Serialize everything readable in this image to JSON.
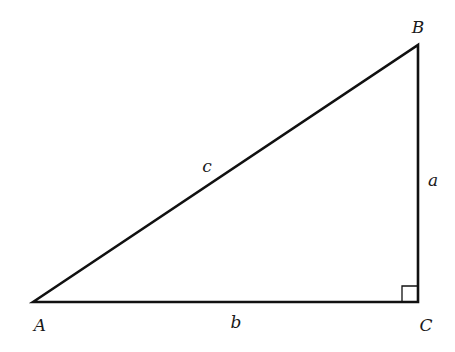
{
  "diagram": {
    "type": "right-triangle",
    "stroke_color": "#111111",
    "vertices": [
      {
        "id": "A",
        "label": "A",
        "x": 33,
        "y": 302,
        "label_x": 40,
        "label_y": 331
      },
      {
        "id": "B",
        "label": "B",
        "x": 418,
        "y": 45,
        "label_x": 418,
        "label_y": 33
      },
      {
        "id": "C",
        "label": "C",
        "x": 418,
        "y": 302,
        "label_x": 426,
        "label_y": 331
      }
    ],
    "sides": [
      {
        "id": "a",
        "label": "a",
        "from": "B",
        "to": "C",
        "label_x": 433,
        "label_y": 186
      },
      {
        "id": "b",
        "label": "b",
        "from": "A",
        "to": "C",
        "label_x": 236,
        "label_y": 328
      },
      {
        "id": "c",
        "label": "c",
        "from": "A",
        "to": "B",
        "label_x": 207,
        "label_y": 172
      }
    ],
    "right_angle_at": "C"
  }
}
